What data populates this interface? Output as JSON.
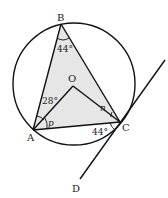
{
  "diagram": {
    "points": {
      "A": "A",
      "B": "B",
      "C": "C",
      "D": "D",
      "O": "O"
    },
    "angles": {
      "B": "44°",
      "OAB": "28°",
      "OAC": "p",
      "OCB": "n",
      "ACD": "44°"
    },
    "colors": {
      "stroke": "#111111",
      "triangle_fill": "#e6e6e6",
      "background": "#ffffff"
    }
  }
}
